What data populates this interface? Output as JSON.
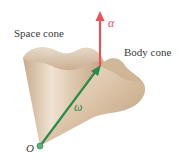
{
  "diagram": {
    "labels": {
      "space_cone": "Space cone",
      "body_cone": "Body cone",
      "origin": "O",
      "omega": "ω",
      "alpha": "α"
    },
    "colors": {
      "background": "#ffffff",
      "cone_fill": "#d9c2a8",
      "cone_shade": "#b8977a",
      "cone_light": "#f1e6d8",
      "omega_arrow": "#2e8a4c",
      "alpha_arrow": "#e8545c",
      "origin_dot": "#5fb07a",
      "label_text": "#3a3a3a"
    },
    "vectors": [
      {
        "name": "omega",
        "label": "ω",
        "from": [
          40,
          146
        ],
        "to": [
          100,
          66
        ],
        "color": "#2e8a4c"
      },
      {
        "name": "alpha",
        "label": "α",
        "from": [
          100,
          64
        ],
        "to": [
          100,
          12
        ],
        "color": "#e8545c"
      }
    ]
  }
}
